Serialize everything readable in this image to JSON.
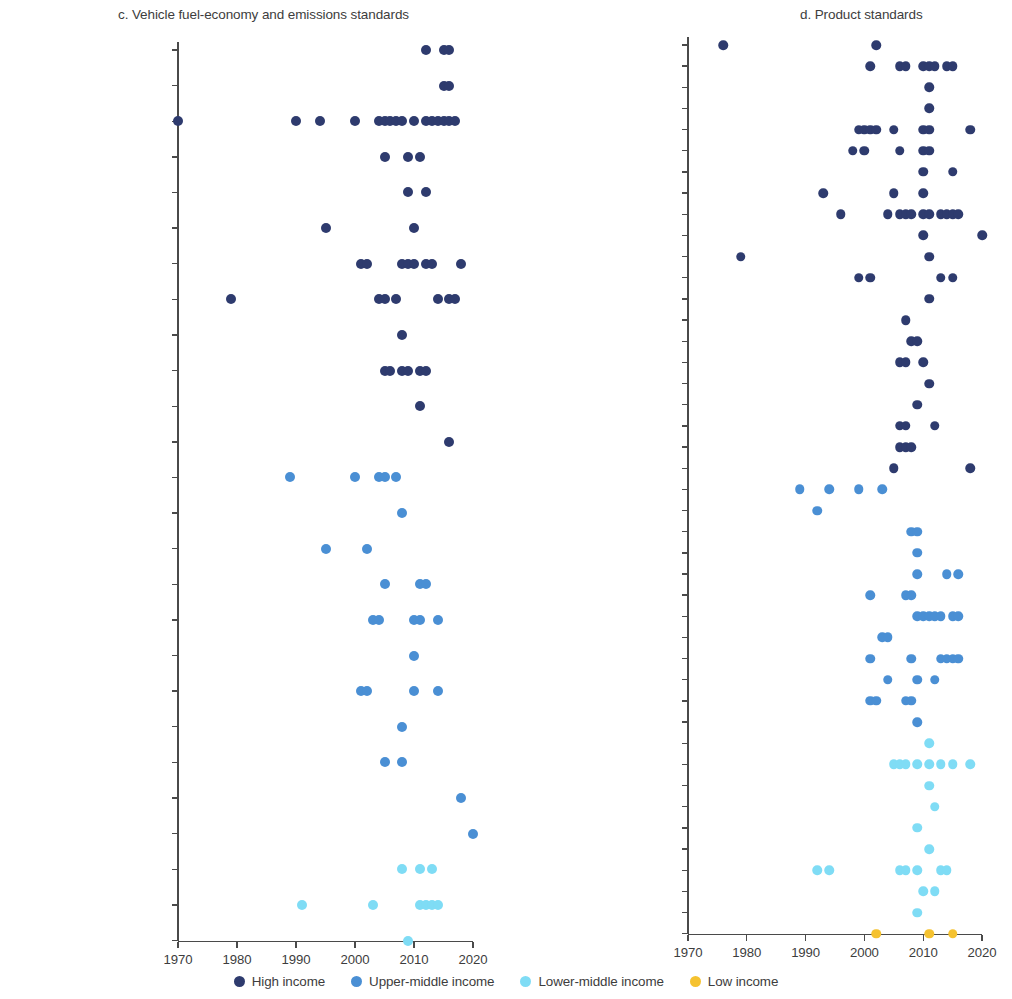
{
  "figure": {
    "width": 1012,
    "height": 999
  },
  "legend": {
    "position": "bottom-center",
    "items": [
      {
        "label": "High income",
        "key": "high",
        "color": "#2e3b6e"
      },
      {
        "label": "Upper-middle income",
        "key": "upper_middle",
        "color": "#4a8fd4"
      },
      {
        "label": "Lower-middle income",
        "key": "lower_middle",
        "color": "#7fdcf5"
      },
      {
        "label": "Low income",
        "key": "low",
        "color": "#f5c230"
      }
    ]
  },
  "colors": {
    "high": "#2e3b6e",
    "upper_middle": "#4a8fd4",
    "lower_middle": "#7fdcf5",
    "low": "#f5c230",
    "axis": "#4a4a4a",
    "text": "#3d3d3d"
  },
  "chart_data": [
    {
      "id": "panel_c",
      "type": "scatter",
      "title": "c. Vehicle fuel-economy and emissions standards",
      "xlabel": "",
      "ylabel": "",
      "xlim": [
        1968,
        2023
      ],
      "xticks": [
        1970,
        1980,
        1990,
        2000,
        2010,
        2020
      ],
      "xtick_labels": [
        "1970",
        "1980",
        "1990",
        "2000",
        "2010",
        "2020"
      ],
      "grid": false,
      "categories": [
        "Switzerland",
        "Norway",
        "United States of America",
        "Sweden",
        "Australia",
        "Germany",
        "Canada",
        "Japan",
        "France",
        "Republic of Korea",
        "South Africa",
        "Chile",
        "China",
        "Russian Federation",
        "Argentina",
        "Türkiye",
        "Mexico",
        "Thailand",
        "Brazil",
        "Peru",
        "South Africa",
        "Colombia",
        "Georgia",
        "Indonesia",
        "India",
        "Uzbekistan"
      ],
      "series": [
        {
          "name": "Switzerland",
          "income_group": "high",
          "values": [
            2012,
            2015,
            2016
          ]
        },
        {
          "name": "Norway",
          "income_group": "high",
          "values": [
            2015,
            2016
          ]
        },
        {
          "name": "United States of America",
          "income_group": "high",
          "values": [
            1970,
            1990,
            1994,
            2000,
            2004,
            2005,
            2006,
            2007,
            2008,
            2010,
            2012,
            2013,
            2014,
            2015,
            2016,
            2017
          ]
        },
        {
          "name": "Sweden",
          "income_group": "high",
          "values": [
            2005,
            2009,
            2011
          ]
        },
        {
          "name": "Australia",
          "income_group": "high",
          "values": [
            2009,
            2012
          ]
        },
        {
          "name": "Germany",
          "income_group": "high",
          "values": [
            1995,
            2010
          ]
        },
        {
          "name": "Canada",
          "income_group": "high",
          "values": [
            2001,
            2002,
            2008,
            2009,
            2010,
            2012,
            2013,
            2018
          ]
        },
        {
          "name": "Japan",
          "income_group": "high",
          "values": [
            1979,
            2004,
            2005,
            2007,
            2014,
            2016,
            2017
          ]
        },
        {
          "name": "France",
          "income_group": "high",
          "values": [
            2008
          ]
        },
        {
          "name": "Republic of Korea",
          "income_group": "high",
          "values": [
            2005,
            2006,
            2008,
            2009,
            2011,
            2012
          ]
        },
        {
          "name": "South Africa",
          "income_group": "high",
          "values": [
            2011
          ]
        },
        {
          "name": "Chile",
          "income_group": "high",
          "values": [
            2016
          ]
        },
        {
          "name": "China",
          "income_group": "upper_middle",
          "values": [
            1989,
            2000,
            2004,
            2005,
            2007
          ]
        },
        {
          "name": "Russian Federation",
          "income_group": "upper_middle",
          "values": [
            2008
          ]
        },
        {
          "name": "Argentina",
          "income_group": "upper_middle",
          "values": [
            1995,
            2002
          ]
        },
        {
          "name": "Türkiye",
          "income_group": "upper_middle",
          "values": [
            2005,
            2011,
            2012
          ]
        },
        {
          "name": "Mexico",
          "income_group": "upper_middle",
          "values": [
            2003,
            2004,
            2010,
            2011,
            2014
          ]
        },
        {
          "name": "Thailand",
          "income_group": "upper_middle",
          "values": [
            2010
          ]
        },
        {
          "name": "Brazil",
          "income_group": "upper_middle",
          "values": [
            2001,
            2002,
            2010,
            2014
          ]
        },
        {
          "name": "Peru",
          "income_group": "upper_middle",
          "values": [
            2008
          ]
        },
        {
          "name": "South Africa",
          "income_group": "upper_middle",
          "values": [
            2005,
            2008
          ]
        },
        {
          "name": "Colombia",
          "income_group": "upper_middle",
          "values": [
            2018
          ]
        },
        {
          "name": "Georgia",
          "income_group": "upper_middle",
          "values": [
            2020
          ]
        },
        {
          "name": "Indonesia",
          "income_group": "lower_middle",
          "values": [
            2008,
            2011,
            2013
          ]
        },
        {
          "name": "India",
          "income_group": "lower_middle",
          "values": [
            1991,
            2003,
            2011,
            2012,
            2013,
            2014
          ]
        },
        {
          "name": "Uzbekistan",
          "income_group": "lower_middle",
          "values": [
            2009
          ]
        }
      ]
    },
    {
      "id": "panel_d",
      "type": "scatter",
      "title": "d. Product standards",
      "xlabel": "",
      "ylabel": "",
      "xlim": [
        1968,
        2023
      ],
      "xticks": [
        1970,
        1980,
        1990,
        2000,
        2010,
        2020
      ],
      "xtick_labels": [
        "1970",
        "1980",
        "1990",
        "2000",
        "2010",
        "2020"
      ],
      "grid": false,
      "categories": [
        "Norway",
        "United States of America",
        "Singapore",
        "Sweden",
        "Australia",
        "Germany",
        "Belgium",
        "Israel",
        "Canada",
        "United Kingdom",
        "Japan",
        "France",
        "United Arab Emirates",
        "Italy",
        "Republic of Korea",
        "Spain",
        "Slovenia",
        "Portugal",
        "Saudi Arabia",
        "Uruguay",
        "Chile",
        "China",
        "Malaysia",
        "Russian Federation",
        "Cuba",
        "Argentina",
        "Türkiye",
        "Mexico",
        "Thailand",
        "Brazil",
        "South Africa",
        "Colombia",
        "Tonga",
        "Mongolia",
        "Indonesia",
        "Ukraine",
        "Egypt",
        "Tunisia",
        "Morocco",
        "India",
        "Zimbabwe",
        "Zambia",
        "Uganda"
      ],
      "series": [
        {
          "name": "Norway",
          "income_group": "high",
          "values": [
            1976,
            2002
          ]
        },
        {
          "name": "United States of America",
          "income_group": "high",
          "values": [
            2001,
            2006,
            2007,
            2010,
            2011,
            2012,
            2014,
            2015
          ]
        },
        {
          "name": "Singapore",
          "income_group": "high",
          "values": [
            2011
          ]
        },
        {
          "name": "Sweden",
          "income_group": "high",
          "values": [
            2011
          ]
        },
        {
          "name": "Australia",
          "income_group": "high",
          "values": [
            1999,
            2000,
            2001,
            2002,
            2005,
            2010,
            2011,
            2018
          ]
        },
        {
          "name": "Germany",
          "income_group": "high",
          "values": [
            1998,
            2000,
            2006,
            2010,
            2011
          ]
        },
        {
          "name": "Belgium",
          "income_group": "high",
          "values": [
            2010,
            2015
          ]
        },
        {
          "name": "Israel",
          "income_group": "high",
          "values": [
            1993,
            2005,
            2010
          ]
        },
        {
          "name": "Canada",
          "income_group": "high",
          "values": [
            1996,
            2004,
            2006,
            2007,
            2008,
            2010,
            2011,
            2013,
            2014,
            2015,
            2016
          ]
        },
        {
          "name": "United Kingdom",
          "income_group": "high",
          "values": [
            2010,
            2020
          ]
        },
        {
          "name": "Japan",
          "income_group": "high",
          "values": [
            1979,
            2011
          ]
        },
        {
          "name": "France",
          "income_group": "high",
          "values": [
            1999,
            2001,
            2013,
            2015
          ]
        },
        {
          "name": "United Arab Emirates",
          "income_group": "high",
          "values": [
            2011
          ]
        },
        {
          "name": "Italy",
          "income_group": "high",
          "values": [
            2007
          ]
        },
        {
          "name": "Republic of Korea",
          "income_group": "high",
          "values": [
            2008,
            2009
          ]
        },
        {
          "name": "Spain",
          "income_group": "high",
          "values": [
            2006,
            2007,
            2010
          ]
        },
        {
          "name": "Slovenia",
          "income_group": "high",
          "values": [
            2011
          ]
        },
        {
          "name": "Portugal",
          "income_group": "high",
          "values": [
            2009
          ]
        },
        {
          "name": "Saudi Arabia",
          "income_group": "high",
          "values": [
            2006,
            2007,
            2012
          ]
        },
        {
          "name": "Uruguay",
          "income_group": "high",
          "values": [
            2006,
            2007,
            2008
          ]
        },
        {
          "name": "Chile",
          "income_group": "high",
          "values": [
            2005,
            2018
          ]
        },
        {
          "name": "China",
          "income_group": "upper_middle",
          "values": [
            1989,
            1994,
            1999,
            2003
          ]
        },
        {
          "name": "Malaysia",
          "income_group": "upper_middle",
          "values": [
            1992
          ]
        },
        {
          "name": "Russian Federation",
          "income_group": "upper_middle",
          "values": [
            2008,
            2009
          ]
        },
        {
          "name": "Cuba",
          "income_group": "upper_middle",
          "values": [
            2009
          ]
        },
        {
          "name": "Argentina",
          "income_group": "upper_middle",
          "values": [
            2009,
            2014,
            2016
          ]
        },
        {
          "name": "Türkiye",
          "income_group": "upper_middle",
          "values": [
            2001,
            2007,
            2008
          ]
        },
        {
          "name": "Mexico",
          "income_group": "upper_middle",
          "values": [
            2009,
            2010,
            2011,
            2012,
            2013,
            2015,
            2016
          ]
        },
        {
          "name": "Thailand",
          "income_group": "upper_middle",
          "values": [
            2003,
            2004
          ]
        },
        {
          "name": "Brazil",
          "income_group": "upper_middle",
          "values": [
            2001,
            2008,
            2013,
            2014,
            2015,
            2016
          ]
        },
        {
          "name": "South Africa",
          "income_group": "upper_middle",
          "values": [
            2004,
            2009,
            2012
          ]
        },
        {
          "name": "Colombia",
          "income_group": "upper_middle",
          "values": [
            2001,
            2002,
            2007,
            2008
          ]
        },
        {
          "name": "Tonga",
          "income_group": "upper_middle",
          "values": [
            2009
          ]
        },
        {
          "name": "Mongolia",
          "income_group": "lower_middle",
          "values": [
            2011
          ]
        },
        {
          "name": "Indonesia",
          "income_group": "lower_middle",
          "values": [
            2005,
            2006,
            2007,
            2009,
            2011,
            2013,
            2015,
            2018
          ]
        },
        {
          "name": "Ukraine",
          "income_group": "lower_middle",
          "values": [
            2011
          ]
        },
        {
          "name": "Egypt",
          "income_group": "lower_middle",
          "values": [
            2012
          ]
        },
        {
          "name": "Tunisia",
          "income_group": "lower_middle",
          "values": [
            2009
          ]
        },
        {
          "name": "Morocco",
          "income_group": "lower_middle",
          "values": [
            2011
          ]
        },
        {
          "name": "India",
          "income_group": "lower_middle",
          "values": [
            1992,
            1994,
            2006,
            2007,
            2009,
            2013,
            2014
          ]
        },
        {
          "name": "Zimbabwe",
          "income_group": "lower_middle",
          "values": [
            2010,
            2012
          ]
        },
        {
          "name": "Zambia",
          "income_group": "lower_middle",
          "values": [
            2009
          ]
        },
        {
          "name": "Uganda",
          "income_group": "low",
          "values": [
            2002,
            2011,
            2015
          ]
        }
      ]
    }
  ]
}
